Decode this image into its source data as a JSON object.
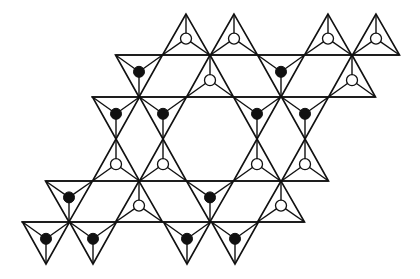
{
  "diagram": {
    "colors": {
      "line": "#111111",
      "background": "#ffffff",
      "filled_atom": "#111111",
      "open_atom": "#ffffff"
    },
    "legend": {
      "filled_circle": "apex pointing one way (down-pointing triangles)",
      "open_circle": "apex pointing the other way (up-pointing triangles)"
    },
    "horizontal_lines": [
      {
        "y": 55,
        "x1": 116,
        "x2": 399
      },
      {
        "y": 97,
        "x1": 92,
        "x2": 375
      },
      {
        "y": 181,
        "x1": 46,
        "x2": 328
      },
      {
        "y": 222,
        "x1": 22,
        "x2": 304
      }
    ],
    "triangles": [
      {
        "dir": "up",
        "cx": 186,
        "top": 14,
        "bottom": 55,
        "atom": "open"
      },
      {
        "dir": "up",
        "cx": 234,
        "top": 14,
        "bottom": 55,
        "atom": "open"
      },
      {
        "dir": "up",
        "cx": 328,
        "top": 14,
        "bottom": 55,
        "atom": "open"
      },
      {
        "dir": "up",
        "cx": 376,
        "top": 14,
        "bottom": 55,
        "atom": "open"
      },
      {
        "dir": "down",
        "cx": 139,
        "top": 55,
        "bottom": 97,
        "atom": "filled"
      },
      {
        "dir": "up",
        "cx": 210,
        "top": 55,
        "bottom": 97,
        "atom": "open"
      },
      {
        "dir": "down",
        "cx": 281,
        "top": 55,
        "bottom": 97,
        "atom": "filled"
      },
      {
        "dir": "up",
        "cx": 352,
        "top": 55,
        "bottom": 97,
        "atom": "open"
      },
      {
        "dir": "down",
        "cx": 116,
        "top": 97,
        "bottom": 139,
        "atom": "filled"
      },
      {
        "dir": "down",
        "cx": 163,
        "top": 97,
        "bottom": 139,
        "atom": "filled"
      },
      {
        "dir": "down",
        "cx": 257,
        "top": 97,
        "bottom": 139,
        "atom": "filled"
      },
      {
        "dir": "down",
        "cx": 305,
        "top": 97,
        "bottom": 139,
        "atom": "filled"
      },
      {
        "dir": "up",
        "cx": 116,
        "top": 139,
        "bottom": 181,
        "atom": "open"
      },
      {
        "dir": "up",
        "cx": 163,
        "top": 139,
        "bottom": 181,
        "atom": "open"
      },
      {
        "dir": "up",
        "cx": 257,
        "top": 139,
        "bottom": 181,
        "atom": "open"
      },
      {
        "dir": "up",
        "cx": 305,
        "top": 139,
        "bottom": 181,
        "atom": "open"
      },
      {
        "dir": "down",
        "cx": 69,
        "top": 181,
        "bottom": 222,
        "atom": "filled"
      },
      {
        "dir": "up",
        "cx": 139,
        "top": 181,
        "bottom": 222,
        "atom": "open"
      },
      {
        "dir": "down",
        "cx": 210,
        "top": 181,
        "bottom": 222,
        "atom": "filled"
      },
      {
        "dir": "up",
        "cx": 281,
        "top": 181,
        "bottom": 222,
        "atom": "open"
      },
      {
        "dir": "down",
        "cx": 46,
        "top": 222,
        "bottom": 264,
        "atom": "filled"
      },
      {
        "dir": "down",
        "cx": 93,
        "top": 222,
        "bottom": 264,
        "atom": "filled"
      },
      {
        "dir": "down",
        "cx": 187,
        "top": 222,
        "bottom": 264,
        "atom": "filled"
      },
      {
        "dir": "down",
        "cx": 235,
        "top": 222,
        "bottom": 264,
        "atom": "filled"
      }
    ],
    "half_width": 23.5,
    "atom_radius": 5.5
  }
}
